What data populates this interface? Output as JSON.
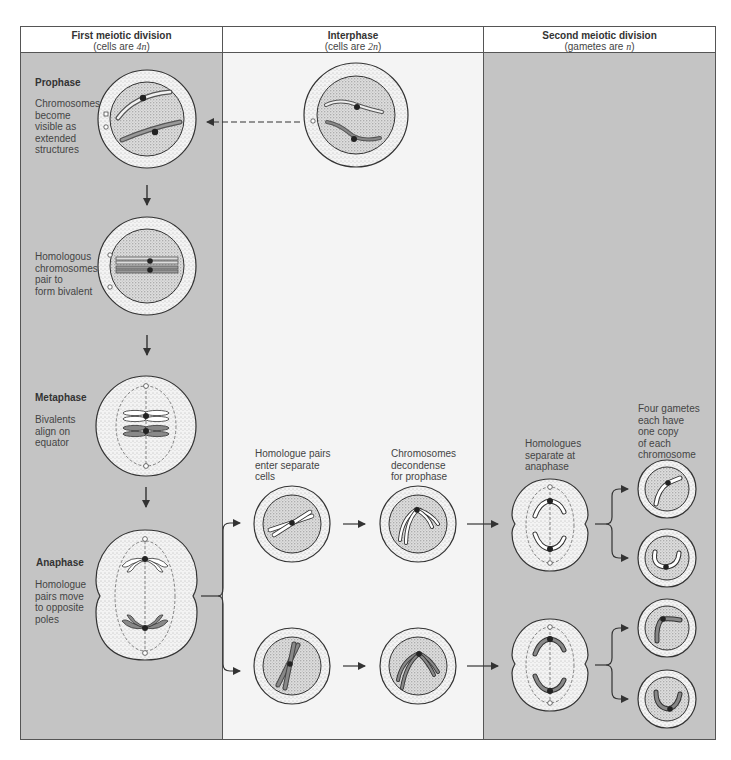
{
  "headers": [
    {
      "title": "First meiotic division",
      "subtitle_pre": "(cells are ",
      "subtitle_var": "4n",
      "subtitle_post": ")"
    },
    {
      "title": "Interphase",
      "subtitle_pre": "(cells are ",
      "subtitle_var": "2n",
      "subtitle_post": ")"
    },
    {
      "title": "Second meiotic division",
      "subtitle_pre": "(gametes are ",
      "subtitle_var": "n",
      "subtitle_post": ")"
    }
  ],
  "stages": {
    "prophase": {
      "title": "Prophase",
      "lines": [
        "Chromosomes",
        "become",
        "visible as",
        "extended",
        "structures"
      ]
    },
    "pairing": {
      "lines": [
        "Homologous",
        "chromosomes",
        "pair to",
        "form bivalent"
      ]
    },
    "metaphase": {
      "title": "Metaphase",
      "lines": [
        "Bivalents",
        "align on",
        "equator"
      ]
    },
    "anaphase": {
      "title": "Anaphase",
      "lines": [
        "Homologue",
        "pairs move",
        "to opposite",
        "poles"
      ]
    }
  },
  "interphase_labels": {
    "enter": [
      "Homologue pairs",
      "enter separate",
      "cells"
    ],
    "decondense": [
      "Chromosomes",
      "decondense",
      "for prophase"
    ]
  },
  "second_division_labels": {
    "separate": [
      "Homologues",
      "separate at",
      "anaphase"
    ],
    "gametes": [
      "Four gametes",
      "each have",
      "one copy",
      "of each",
      "chromosome"
    ]
  },
  "colors": {
    "panel_gray": "#c4c4c4",
    "panel_light": "#f4f4f4",
    "border": "#555555",
    "cell_fill": "#efefef",
    "chromosome_dark": "#7a7a7a"
  }
}
